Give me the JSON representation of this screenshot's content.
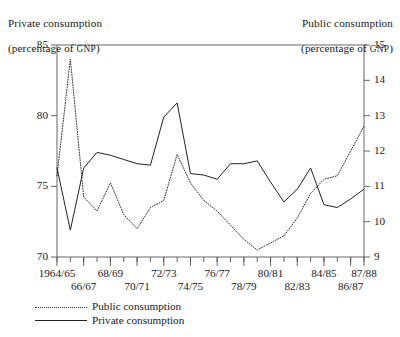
{
  "chart_data": {
    "type": "line",
    "title": "",
    "categories": [
      "1964/65",
      "65/66",
      "66/67",
      "67/68",
      "68/69",
      "69/70",
      "70/71",
      "71/72",
      "72/73",
      "73/74",
      "74/75",
      "75/76",
      "76/77",
      "77/78",
      "78/79",
      "79/80",
      "80/81",
      "81/82",
      "82/83",
      "83/84",
      "84/85",
      "85/86",
      "86/87",
      "87/88"
    ],
    "xtick_labels_upper": [
      "1964/65",
      "68/69",
      "72/73",
      "76/77",
      "80/81",
      "84/85",
      "87/88"
    ],
    "xtick_labels_lower": [
      "66/67",
      "70/71",
      "74/75",
      "78/79",
      "82/83",
      "86/87"
    ],
    "xlabel": "",
    "grid": false,
    "legend_position": "below-left",
    "axes": {
      "left": {
        "label": "Private consumption\n(percentage of GNP)",
        "label_main": "Private consumption",
        "label_sub_prefix": "(percentage of ",
        "label_sub_caps": "GNP",
        "label_sub_suffix": ")",
        "ticks": [
          70,
          75,
          80,
          85
        ],
        "ylim": [
          70,
          85
        ]
      },
      "right": {
        "label": "Public consumption\n(percentage of GNP)",
        "label_main": "Public consumption",
        "label_sub_prefix": "(percentage of ",
        "label_sub_caps": "GNP",
        "label_sub_suffix": ")",
        "ticks": [
          9,
          10,
          11,
          12,
          13,
          14,
          15
        ],
        "ylim": [
          9,
          15
        ]
      }
    },
    "series": [
      {
        "name": "Public consumption",
        "axis": "right",
        "style": "dotted",
        "color": "#333333",
        "values": [
          11.3,
          14.6,
          10.7,
          10.3,
          11.1,
          10.2,
          9.8,
          10.4,
          10.6,
          11.9,
          11.1,
          10.6,
          10.3,
          9.9,
          9.5,
          9.2,
          9.4,
          9.6,
          10.1,
          10.8,
          11.2,
          11.3,
          12.0,
          12.7
        ]
      },
      {
        "name": "Private consumption",
        "axis": "left",
        "style": "solid",
        "color": "#222222",
        "values": [
          76.3,
          71.9,
          76.3,
          77.4,
          77.2,
          76.9,
          76.6,
          76.5,
          79.9,
          80.9,
          75.9,
          75.8,
          75.5,
          76.6,
          76.6,
          76.8,
          75.3,
          73.9,
          74.8,
          76.3,
          73.7,
          73.5,
          74.1,
          74.8
        ]
      }
    ],
    "legend": [
      {
        "label": "Public consumption",
        "style": "dotted"
      },
      {
        "label": "Private consumption",
        "style": "solid"
      }
    ]
  }
}
